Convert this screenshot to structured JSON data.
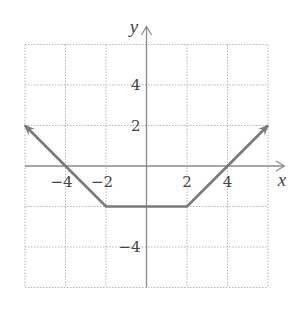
{
  "chart_data": {
    "type": "line",
    "title": "",
    "xlabel": "x",
    "ylabel": "y",
    "xlim": [
      -6,
      6
    ],
    "ylim": [
      -6,
      6
    ],
    "grid": true,
    "grid_step": 2,
    "x_tick_labels": [
      {
        "value": -4,
        "label": "−4"
      },
      {
        "value": -2,
        "label": "−2"
      },
      {
        "value": 2,
        "label": "2"
      },
      {
        "value": 4,
        "label": "4"
      }
    ],
    "y_tick_labels": [
      {
        "value": 4,
        "label": "4"
      },
      {
        "value": 2,
        "label": "2"
      },
      {
        "value": -4,
        "label": "−4"
      }
    ],
    "series": [
      {
        "name": "piecewise function",
        "points": [
          [
            -6,
            2
          ],
          [
            -4,
            0
          ],
          [
            -2,
            -2
          ],
          [
            2,
            -2
          ],
          [
            4,
            0
          ],
          [
            6,
            2
          ]
        ],
        "arrows": [
          "left",
          "right"
        ],
        "color": "#7a7a7a"
      }
    ],
    "legend": null
  },
  "colors": {
    "grid": "#b5b5b5",
    "axis": "#8a8a8a",
    "curve": "#7a7a7a",
    "text": "#444444"
  }
}
